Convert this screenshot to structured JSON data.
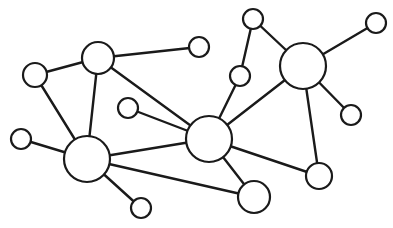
{
  "diagram": {
    "type": "network-graph",
    "width": 393,
    "height": 228,
    "background": "#ffffff",
    "stroke_color": "#1a1a1a",
    "node_fill": "#ffffff",
    "nodes": [
      {
        "id": "n1",
        "x": 98,
        "y": 58,
        "r": 16
      },
      {
        "id": "n2",
        "x": 35,
        "y": 75,
        "r": 12
      },
      {
        "id": "n3",
        "x": 199,
        "y": 47,
        "r": 10
      },
      {
        "id": "n4",
        "x": 128,
        "y": 108,
        "r": 10
      },
      {
        "id": "n5",
        "x": 21,
        "y": 139,
        "r": 10
      },
      {
        "id": "n6",
        "x": 87,
        "y": 159,
        "r": 23
      },
      {
        "id": "n7",
        "x": 209,
        "y": 139,
        "r": 23
      },
      {
        "id": "n8",
        "x": 141,
        "y": 208,
        "r": 10
      },
      {
        "id": "n9",
        "x": 254,
        "y": 197,
        "r": 16
      },
      {
        "id": "n10",
        "x": 319,
        "y": 176,
        "r": 13
      },
      {
        "id": "n11",
        "x": 303,
        "y": 66,
        "r": 23
      },
      {
        "id": "n12",
        "x": 253,
        "y": 19,
        "r": 10
      },
      {
        "id": "n13",
        "x": 240,
        "y": 76,
        "r": 10
      },
      {
        "id": "n14",
        "x": 376,
        "y": 23,
        "r": 10
      },
      {
        "id": "n15",
        "x": 351,
        "y": 115,
        "r": 10
      }
    ],
    "edges": [
      [
        "n1",
        "n2"
      ],
      [
        "n1",
        "n3"
      ],
      [
        "n1",
        "n6"
      ],
      [
        "n1",
        "n7"
      ],
      [
        "n2",
        "n6"
      ],
      [
        "n5",
        "n6"
      ],
      [
        "n4",
        "n7"
      ],
      [
        "n6",
        "n7"
      ],
      [
        "n6",
        "n8"
      ],
      [
        "n6",
        "n9"
      ],
      [
        "n7",
        "n9"
      ],
      [
        "n7",
        "n10"
      ],
      [
        "n7",
        "n13"
      ],
      [
        "n7",
        "n11"
      ],
      [
        "n13",
        "n12"
      ],
      [
        "n12",
        "n11"
      ],
      [
        "n11",
        "n14"
      ],
      [
        "n11",
        "n15"
      ],
      [
        "n11",
        "n10"
      ]
    ]
  }
}
